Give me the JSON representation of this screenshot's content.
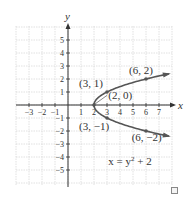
{
  "chart_data": {
    "type": "line",
    "title": "",
    "xlabel": "x",
    "ylabel": "y",
    "xlim": [
      -4,
      8
    ],
    "ylim": [
      -6,
      6
    ],
    "grid": true,
    "x_ticks": [
      -3,
      -2,
      -1,
      1,
      2,
      3,
      4,
      5,
      6,
      7
    ],
    "y_ticks": [
      -5,
      -4,
      -3,
      -2,
      -1,
      1,
      2,
      3,
      4,
      5
    ],
    "x_tick_labels": [
      "−3",
      "−2",
      "−1",
      "1",
      "2",
      "3",
      "4",
      "5",
      "6",
      "7"
    ],
    "y_tick_labels": [
      "−5",
      "−4",
      "−3",
      "−2",
      "−1",
      "1",
      "2",
      "3",
      "4",
      "5"
    ],
    "series": [
      {
        "name": "x = y^2 + 2",
        "equation": "x = y^2 + 2",
        "y_range": [
          -2.4,
          2.4
        ],
        "arrows": "both-ends"
      }
    ],
    "points": [
      {
        "x": 2,
        "y": 0,
        "label": "(2, 0)"
      },
      {
        "x": 3,
        "y": 1,
        "label": "(3, 1)"
      },
      {
        "x": 3,
        "y": -1,
        "label": "(3, −1)"
      },
      {
        "x": 6,
        "y": 2,
        "label": "(6, 2)"
      },
      {
        "x": 6,
        "y": -2,
        "label": "(6, −2)"
      }
    ],
    "equation_label": {
      "base": "x = y",
      "exponent": "2",
      "suffix": " + 2"
    }
  },
  "checkbox": {
    "checked": false
  }
}
